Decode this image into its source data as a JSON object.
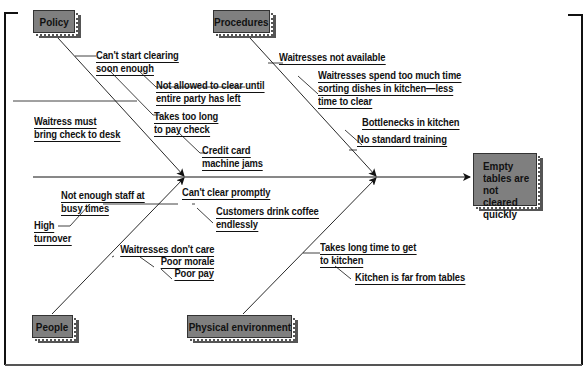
{
  "diagram": {
    "type": "fishbone",
    "effect": "Empty tables are not cleared quickly",
    "categories": {
      "policy": {
        "label": "Policy",
        "causes": [
          {
            "text": "Can't start clearing soon enough",
            "lines": [
              "Can't start clearing",
              "soon enough"
            ]
          },
          {
            "text": "Not allowed to clear until entire party has left",
            "lines": [
              "Not allowed to clear until",
              "entire party has left"
            ]
          },
          {
            "text": "Takes too long to pay check",
            "lines": [
              "Takes too long",
              "to pay check"
            ]
          },
          {
            "text": "Credit card machine jams",
            "lines": [
              "Credit card",
              "machine jams"
            ]
          },
          {
            "text": "Waitress must bring check to desk",
            "lines": [
              "Waitress must",
              "bring check to desk"
            ]
          }
        ]
      },
      "procedures": {
        "label": "Procedures",
        "causes": [
          {
            "text": "Waitresses not available",
            "lines": [
              "Waitresses not available"
            ]
          },
          {
            "text": "Waitresses spend too much time sorting dishes in kitchen—less time to clear",
            "lines": [
              "Waitresses spend too much time",
              "sorting dishes in kitchen—less",
              "time to clear"
            ]
          },
          {
            "text": "Bottlenecks in kitchen",
            "lines": [
              "Bottlenecks in kitchen"
            ]
          },
          {
            "text": "No standard training",
            "lines": [
              "No standard training"
            ]
          }
        ]
      },
      "people": {
        "label": "People",
        "causes": [
          {
            "text": "Not enough staff at busy times",
            "lines": [
              "Not enough staff at",
              "busy times"
            ]
          },
          {
            "text": "High turnover",
            "lines": [
              "High",
              "turnover"
            ]
          },
          {
            "text": "Can't clear promptly",
            "lines": [
              "Can't clear promptly"
            ]
          },
          {
            "text": "Customers drink coffee endlessly",
            "lines": [
              "Customers drink coffee",
              "endlessly"
            ]
          },
          {
            "text": "Waitresses don't care",
            "lines": [
              "Waitresses don't care"
            ]
          },
          {
            "text": "Poor morale",
            "lines": [
              "Poor morale"
            ]
          },
          {
            "text": "Poor pay",
            "lines": [
              "Poor pay"
            ]
          }
        ]
      },
      "physical": {
        "label": "Physical environment",
        "causes": [
          {
            "text": "Takes long time to get to kitchen",
            "lines": [
              "Takes long time to get",
              "to kitchen"
            ]
          },
          {
            "text": "Kitchen is far from tables",
            "lines": [
              "Kitchen is far from tables"
            ]
          }
        ]
      }
    },
    "colors": {
      "box_fill": "#7f7f7f",
      "box_shadow": "#555555",
      "line": "#111111",
      "background": "#ffffff"
    }
  }
}
